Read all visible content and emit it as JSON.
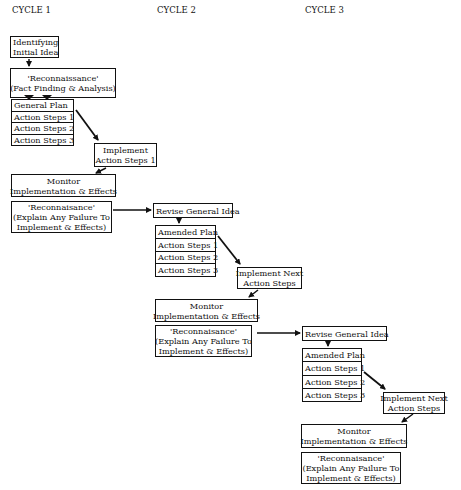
{
  "cycles": [
    {
      "title": "CYCLE 1",
      "start": {
        "line1": "Identifying",
        "line2": "Initial Idea"
      },
      "recon_initial": {
        "line1": "'Reconnaissance'",
        "line2": "(Fact Finding & Analysis)"
      },
      "plan": {
        "header": "General Plan",
        "steps": [
          "Action Steps 1",
          "Action Steps 2",
          "Action Steps 3"
        ]
      },
      "implement": {
        "line1": "Implement",
        "line2": "Action Steps 1"
      },
      "monitor": {
        "line1": "Monitor",
        "line2": "Implementation & Effects"
      },
      "recon": {
        "line1": "'Reconnaisance'",
        "line2": "(Explain Any Failure To",
        "line3": "Implement & Effects)"
      }
    },
    {
      "title": "CYCLE 2",
      "revise": {
        "label": "Revise General Idea"
      },
      "plan": {
        "header": "Amended Plan",
        "steps": [
          "Action Steps 1",
          "Action Steps 2",
          "Action Steps 3"
        ]
      },
      "implement": {
        "line1": "Implement Next",
        "line2": "Action Steps"
      },
      "monitor": {
        "line1": "Monitor",
        "line2": "Implementation & Effects"
      },
      "recon": {
        "line1": "'Reconnaisance'",
        "line2": "(Explain Any Failure To",
        "line3": "Implement & Effects)"
      }
    },
    {
      "title": "CYCLE 3",
      "revise": {
        "label": "Revise General Idea"
      },
      "plan": {
        "header": "Amended Plan",
        "steps": [
          "Action Steps 1",
          "Action Steps 2",
          "Action Steps 3"
        ]
      },
      "implement": {
        "line1": "Implement Next",
        "line2": "Action Steps"
      },
      "monitor": {
        "line1": "Monitor",
        "line2": "Implementation & Effects"
      },
      "recon": {
        "line1": "'Reconnaisance'",
        "line2": "(Explain Any Failure To",
        "line3": "Implement & Effects)"
      }
    }
  ],
  "colors": {
    "line": "#111111",
    "background": "#ffffff"
  }
}
